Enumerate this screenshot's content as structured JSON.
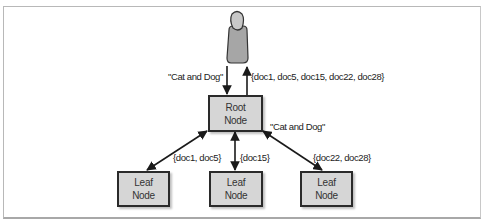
{
  "diagram": {
    "user": {
      "icon": "person-icon",
      "head_color": "#c8c8c8",
      "body_color": "#a6a6a6",
      "outline_color": "#333333"
    },
    "root_node": {
      "line1": "Root",
      "line2": "Node"
    },
    "leaf_nodes": [
      {
        "line1": "Leaf",
        "line2": "Node"
      },
      {
        "line1": "Leaf",
        "line2": "Node"
      },
      {
        "line1": "Leaf",
        "line2": "Node"
      }
    ],
    "labels": {
      "query_to_root": "\"Cat and Dog\"",
      "root_results": "{doc1, doc5, doc15, doc22, doc28}",
      "query_to_leaves": "\"Cat and Dog\"",
      "leaf1_results": "{doc1, doc5}",
      "leaf2_results": "{doc15}",
      "leaf3_results": "{doc22, doc28}"
    },
    "colors": {
      "node_fill": "#d6d6d6",
      "node_border": "#2a2a2a",
      "arrow": "#1a1a1a",
      "frame": "#b8b8b8"
    }
  }
}
